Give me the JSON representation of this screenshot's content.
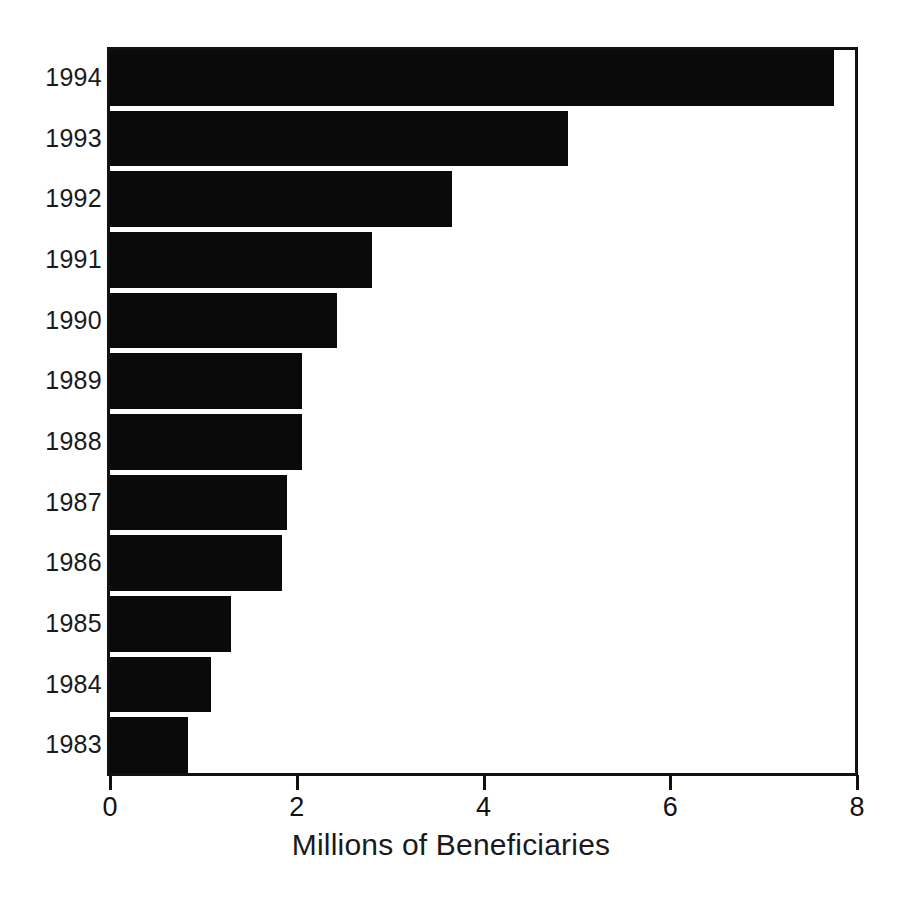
{
  "chart_data": {
    "type": "bar",
    "orientation": "horizontal",
    "title": "",
    "subtitle": "",
    "xlabel": "Millions of Beneficiaries",
    "ylabel": "",
    "categories": [
      "1983",
      "1984",
      "1985",
      "1986",
      "1987",
      "1988",
      "1989",
      "1990",
      "1991",
      "1992",
      "1993",
      "1994"
    ],
    "values": [
      0.83,
      1.08,
      1.3,
      1.84,
      1.9,
      2.06,
      2.06,
      2.43,
      2.81,
      3.66,
      4.9,
      7.75
    ],
    "display_order": [
      "1994",
      "1993",
      "1992",
      "1991",
      "1990",
      "1989",
      "1988",
      "1987",
      "1986",
      "1985",
      "1984",
      "1983"
    ],
    "xlim": [
      0,
      8
    ],
    "ylim": null,
    "xticks": [
      0,
      2,
      4,
      6,
      8
    ],
    "xtick_labels": [
      "0",
      "2",
      "4",
      "6",
      "8"
    ],
    "grid": false,
    "legend": false,
    "legend_position": "none",
    "bar_color": "#0a0a0a",
    "background_color": "#ffffff",
    "series": [
      {
        "name": "Beneficiaries",
        "values": [
          7.75,
          4.9,
          3.66,
          2.81,
          2.43,
          2.06,
          2.06,
          1.9,
          1.84,
          1.3,
          1.08,
          0.83
        ],
        "categories": [
          "1994",
          "1993",
          "1992",
          "1991",
          "1990",
          "1989",
          "1988",
          "1987",
          "1986",
          "1985",
          "1984",
          "1983"
        ]
      }
    ],
    "annotations": []
  }
}
